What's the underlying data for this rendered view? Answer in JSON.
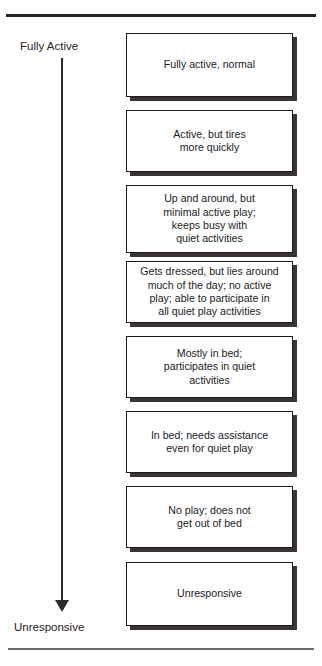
{
  "figure": {
    "axis": {
      "top_label": "Fully Active",
      "bottom_label": "Unresponsive",
      "direction_icon": "down-arrow-icon"
    },
    "colors": {
      "ink": "#231f20",
      "rule_top": "#2b2526",
      "rule_bottom": "#6e6e70",
      "box_border": "#1e1a1b",
      "box_shadow": "#3a3435",
      "box_fill": "#ffffff"
    },
    "levels": [
      {
        "index": 1,
        "text": "Fully active, normal",
        "top": 33,
        "height": 64
      },
      {
        "index": 2,
        "text": "Active, but tires\nmore quickly",
        "top": 110,
        "height": 62
      },
      {
        "index": 3,
        "text": "Up and around, but\nminimal active play;\nkeeps busy with\nquiet activities",
        "top": 185,
        "height": 68
      },
      {
        "index": 4,
        "text": "Gets dressed, but lies around\nmuch of the day; no active\nplay; able to participate in\nall quiet play activities",
        "top": 261,
        "height": 62
      },
      {
        "index": 5,
        "text": "Mostly in bed;\nparticipates in quiet\nactivities",
        "top": 336,
        "height": 62
      },
      {
        "index": 6,
        "text": "In bed; needs assistance\neven for quiet play",
        "top": 411,
        "height": 62
      },
      {
        "index": 7,
        "text": "No play; does not\nget out of bed",
        "top": 486,
        "height": 62
      },
      {
        "index": 8,
        "text": "Unresponsive",
        "top": 562,
        "height": 64
      }
    ]
  }
}
